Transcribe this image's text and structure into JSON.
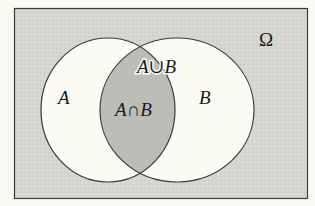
{
  "diagram": {
    "type": "venn",
    "universe_label": "Ω",
    "sets": [
      {
        "id": "A",
        "label": "A"
      },
      {
        "id": "B",
        "label": "B"
      }
    ],
    "labels": {
      "set_a": "A",
      "set_b": "B",
      "intersection": "A∩B",
      "union": "A∪B",
      "universe": "Ω"
    },
    "colors": {
      "background": "#fbfbf4",
      "universe_fill": "#d6d6d0",
      "circle_fill": "#fbfbf4",
      "intersection_fill": "#bdbdb8",
      "stroke": "#3a3a3a"
    }
  }
}
